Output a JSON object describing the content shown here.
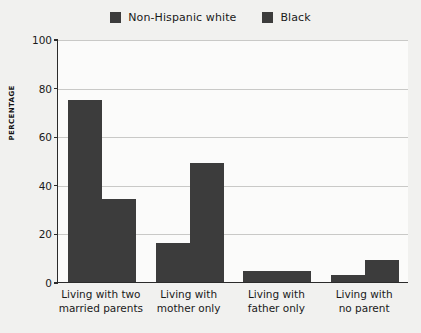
{
  "chart_data": {
    "type": "bar",
    "title": "",
    "xlabel": "",
    "ylabel": "PERCENTAGE",
    "ylim": [
      0,
      100
    ],
    "yticks": [
      0,
      20,
      40,
      60,
      80,
      100
    ],
    "grid": true,
    "legend_position": "top-center",
    "categories": [
      "Living with two married parents",
      "Living with mother only",
      "Living with father only",
      "Living with no parent"
    ],
    "category_lines": [
      [
        "Living with two",
        "married parents"
      ],
      [
        "Living with",
        "mother only"
      ],
      [
        "Living with",
        "father only"
      ],
      [
        "Living with",
        "no parent"
      ]
    ],
    "series": [
      {
        "name": "Non-Hispanic white",
        "color": "#3c3c3c",
        "values": [
          75,
          16,
          4.5,
          3
        ]
      },
      {
        "name": "Black",
        "color": "#3c3c3c",
        "values": [
          34,
          49,
          4.5,
          9
        ]
      }
    ]
  },
  "legend": {
    "entries": [
      {
        "label": "Non-Hispanic white",
        "color": "#3c3c3c"
      },
      {
        "label": "Black",
        "color": "#3c3c3c"
      }
    ]
  },
  "axis": {
    "y_label": "PERCENTAGE",
    "y_ticks": [
      "0",
      "20",
      "40",
      "60",
      "80",
      "100"
    ]
  }
}
